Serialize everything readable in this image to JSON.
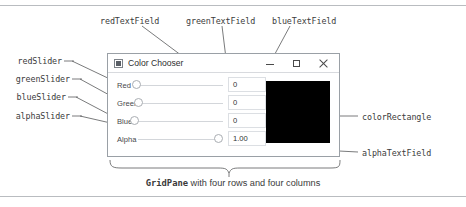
{
  "figure": {
    "caption_code": "GridPane",
    "caption_rest": " with four rows and four columns"
  },
  "window": {
    "title": "Color Chooser",
    "icon": "app-window-icon",
    "controls": {
      "minimize": "minimize-icon",
      "maximize": "maximize-icon",
      "close": "close-icon"
    }
  },
  "gridpane": {
    "rows": [
      {
        "label": "Red",
        "slider": "redSlider",
        "slider_value": 0,
        "field": "redTextField",
        "field_value": "0"
      },
      {
        "label": "Green",
        "slider": "greenSlider",
        "slider_value": 0,
        "field": "greenTextField",
        "field_value": "0"
      },
      {
        "label": "Blue",
        "slider": "blueSlider",
        "slider_value": 0,
        "field": "blueTextField",
        "field_value": "0"
      },
      {
        "label": "Alpha",
        "slider": "alphaSlider",
        "slider_value": 1.0,
        "field": "alphaTextField",
        "field_value": "1.00"
      }
    ],
    "color_rectangle": {
      "name": "colorRectangle",
      "fill": "#000000"
    }
  },
  "annotations": {
    "left": [
      {
        "text": "redSlider"
      },
      {
        "text": "greenSlider"
      },
      {
        "text": "blueSlider"
      },
      {
        "text": "alphaSlider"
      }
    ],
    "top": [
      {
        "text": "redTextField"
      },
      {
        "text": "greenTextField"
      },
      {
        "text": "blueTextField"
      }
    ],
    "right": [
      {
        "text": "colorRectangle"
      },
      {
        "text": "alphaTextField"
      }
    ]
  },
  "colors": {
    "ink": "#3a3a3a",
    "rule": "#b9bcc0",
    "window_border": "#9aa0a6",
    "field_border": "#dcdfe3",
    "track": "#d3d6da",
    "swatch": "#000000"
  }
}
